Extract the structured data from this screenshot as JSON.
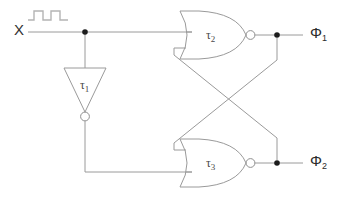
{
  "diagram": {
    "type": "logic-circuit-schematic",
    "canvas": {
      "width": 346,
      "height": 198,
      "background": "#ffffff"
    },
    "colors": {
      "wire": "#9a9a9a",
      "gate_outline": "#9a9a9a",
      "bubble_fill": "#ffffff",
      "junction_dot": "#1c1c1c",
      "label_text": "#2b2b2b",
      "waveform": "#b4b4b4"
    }
  },
  "labels": {
    "input_signal": "X",
    "inverter_label": "τ",
    "inverter_index": "1",
    "nor_top_label": "τ",
    "nor_top_index": "2",
    "nor_bottom_label": "τ",
    "nor_bottom_index": "3",
    "output_top": "Φ",
    "output_top_index": "1",
    "output_bottom": "Φ",
    "output_bottom_index": "2"
  },
  "components": [
    {
      "id": "input-port-x",
      "kind": "input-port",
      "label": "X",
      "annotation": "square-wave-symbol",
      "position": {
        "x": 18,
        "y": 32
      }
    },
    {
      "id": "inverter-tau1",
      "kind": "inverter",
      "label": "τ₁",
      "orientation": "down",
      "inverting_bubble": true,
      "position": {
        "x": 85,
        "y": 88
      }
    },
    {
      "id": "nor-gate-tau2",
      "kind": "nor-gate",
      "label": "τ₂",
      "inputs": 2,
      "inverting_bubble": true,
      "position": {
        "x": 212,
        "y": 35
      }
    },
    {
      "id": "nor-gate-tau3",
      "kind": "nor-gate",
      "label": "τ₃",
      "inputs": 2,
      "inverting_bubble": true,
      "position": {
        "x": 212,
        "y": 163
      }
    },
    {
      "id": "output-port-phi1",
      "kind": "output-port",
      "label": "Φ₁",
      "position": {
        "x": 310,
        "y": 35
      }
    },
    {
      "id": "output-port-phi2",
      "kind": "output-port",
      "label": "Φ₂",
      "position": {
        "x": 310,
        "y": 163
      }
    }
  ],
  "nets": [
    {
      "id": "net-x",
      "from": "input-port-x",
      "to": [
        "nor-gate-tau2.in1",
        "inverter-tau1.in"
      ],
      "junction": {
        "x": 85,
        "y": 32
      }
    },
    {
      "id": "net-inv-out",
      "from": "inverter-tau1.out",
      "to": [
        "nor-gate-tau3.in2"
      ]
    },
    {
      "id": "net-phi1",
      "from": "nor-gate-tau2.out",
      "to": [
        "output-port-phi1",
        "nor-gate-tau3.in1"
      ],
      "junction": {
        "x": 277,
        "y": 35
      }
    },
    {
      "id": "net-phi2",
      "from": "nor-gate-tau3.out",
      "to": [
        "output-port-phi2",
        "nor-gate-tau2.in2"
      ],
      "junction": {
        "x": 277,
        "y": 163
      }
    }
  ],
  "waveform": {
    "name": "square-wave-symbol",
    "pulses": 2,
    "low_level": 20,
    "high_level": 11
  }
}
